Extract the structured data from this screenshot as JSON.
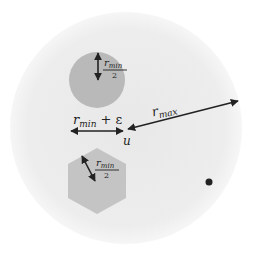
{
  "diagram": {
    "type": "geometric-schematic",
    "colors": {
      "background": "#ffffff",
      "outer_region": "#ececec",
      "circle_obstacle": "#b9b9b9",
      "hexagon_obstacle": "#c4c4c4",
      "ink": "#222222"
    },
    "outer_region": {
      "shape": "circle",
      "cx": 126,
      "cy": 128,
      "r": 116
    },
    "circle_obstacle": {
      "shape": "circle",
      "cx": 97,
      "cy": 80,
      "r": 28,
      "radius_label": {
        "numerator": "r",
        "numerator_sub": "min",
        "denominator": "2"
      }
    },
    "hexagon_obstacle": {
      "shape": "hexagon",
      "cx": 97,
      "cy": 181,
      "r": 33,
      "radius_label": {
        "numerator": "r",
        "numerator_sub": "min",
        "denominator": "2"
      }
    },
    "gap_arrow": {
      "label_main": "r",
      "label_sub": "min",
      "label_suffix": " + ε"
    },
    "rmax_arrow": {
      "label_main": "r",
      "label_sub": "max"
    },
    "point_u": {
      "label": "u",
      "x": 127,
      "y": 131
    },
    "goal_dot": {
      "x": 209,
      "y": 182,
      "r": 3.5
    }
  }
}
